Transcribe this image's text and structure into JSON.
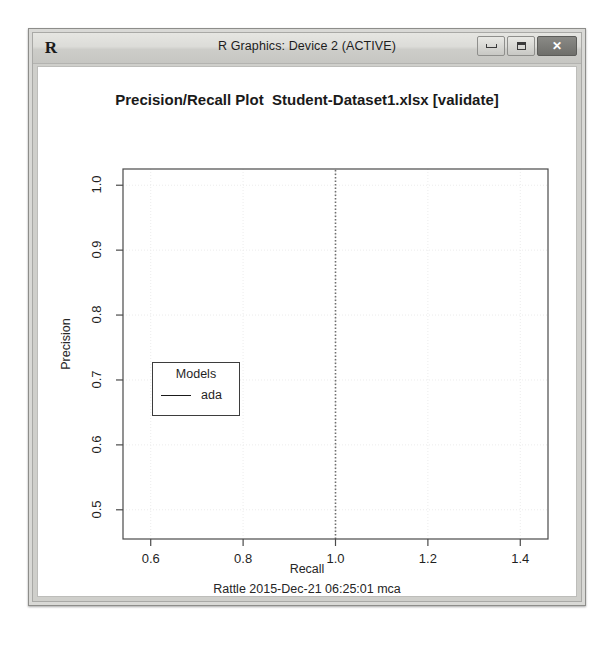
{
  "window": {
    "title": "R Graphics: Device 2 (ACTIVE)",
    "app_icon": "R",
    "icon_name": "r-logo-icon",
    "controls": {
      "minimize": "minimize-icon",
      "maximize": "maximize-icon",
      "close": "✕"
    }
  },
  "chart_data": {
    "type": "line",
    "title": "Precision/Recall Plot  Student-Dataset1.xlsx [validate]",
    "xlabel": "Recall",
    "ylabel": "Precision",
    "footer": "Rattle 2015-Dec-21 06:25:01 mca",
    "xlim": [
      0.54,
      1.46
    ],
    "ylim": [
      0.455,
      1.025
    ],
    "xticks": [
      0.6,
      0.8,
      1.0,
      1.2,
      1.4
    ],
    "xtick_labels": [
      "0.6",
      "0.8",
      "1.0",
      "1.2",
      "1.4"
    ],
    "yticks": [
      0.5,
      0.6,
      0.7,
      0.8,
      0.9,
      1.0
    ],
    "ytick_labels": [
      "0.5",
      "0.6",
      "0.7",
      "0.8",
      "0.9",
      "1.0"
    ],
    "grid": true,
    "grid_style": "dotted",
    "grid_color": "#ececec",
    "legend": {
      "position": "bottom-left",
      "title": "Models",
      "entries": [
        {
          "name": "ada",
          "color": "#1a1a1a",
          "style": "solid"
        }
      ]
    },
    "series": [
      {
        "name": "ada",
        "color": "#6f6f6f",
        "style": "dotted",
        "note": "Degenerate curve: all points at Recall = 1.0",
        "x": [
          1.0,
          1.0
        ],
        "y": [
          0.455,
          1.025
        ]
      }
    ]
  }
}
